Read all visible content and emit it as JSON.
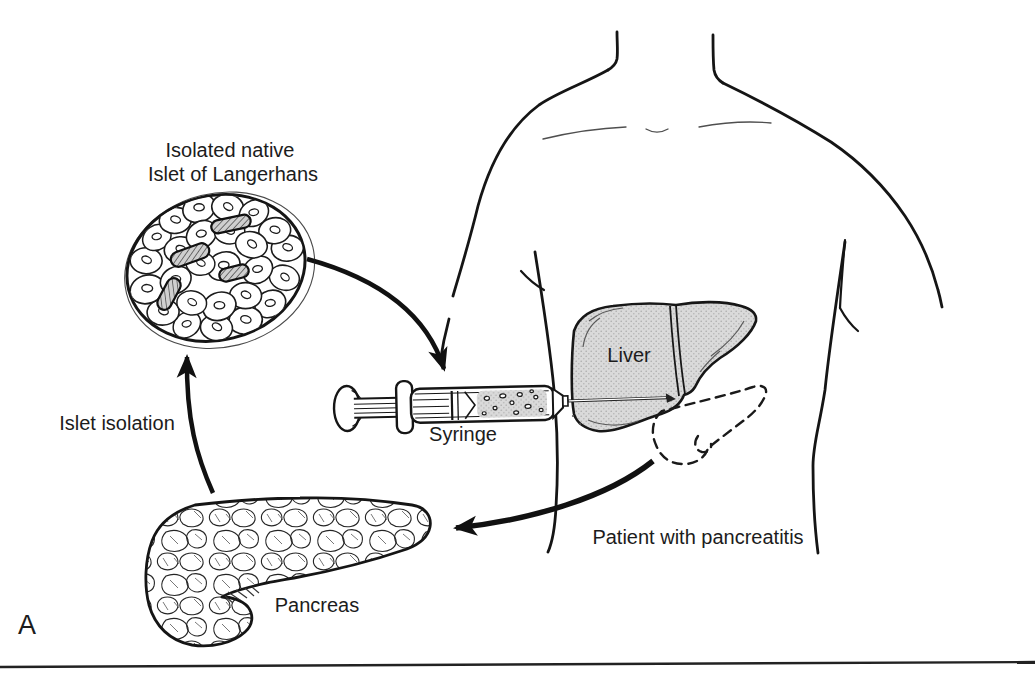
{
  "figure": {
    "panel_label": "A",
    "labels": {
      "islet_title_line1": "Isolated native",
      "islet_title_line2": "Islet of Langerhans",
      "islet_isolation": "Islet isolation",
      "syringe": "Syringe",
      "liver": "Liver",
      "pancreas": "Pancreas",
      "patient": "Patient with pancreatitis"
    },
    "colors": {
      "line": "#1a1a1a",
      "organ_fill": "#dadada",
      "background": "#ffffff"
    }
  }
}
